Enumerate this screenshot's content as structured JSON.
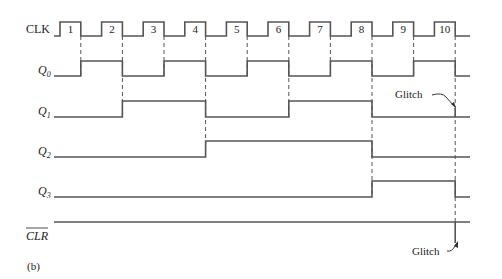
{
  "figure": {
    "caption": "(b)",
    "clock": {
      "label": "CLK",
      "pulse_numbers": [
        "1",
        "2",
        "3",
        "4",
        "5",
        "6",
        "7",
        "8",
        "9",
        "10"
      ]
    },
    "signals": [
      {
        "name": "Q",
        "subscript": "0",
        "initial": 0,
        "values_after_each_clk": [
          1,
          0,
          1,
          0,
          1,
          0,
          1,
          0,
          1,
          0
        ]
      },
      {
        "name": "Q",
        "subscript": "1",
        "initial": 0,
        "values_after_each_clk": [
          0,
          1,
          1,
          0,
          0,
          1,
          1,
          0,
          0,
          0
        ]
      },
      {
        "name": "Q",
        "subscript": "2",
        "initial": 0,
        "values_after_each_clk": [
          0,
          0,
          0,
          1,
          1,
          1,
          1,
          0,
          0,
          0
        ]
      },
      {
        "name": "Q",
        "subscript": "3",
        "initial": 0,
        "values_after_each_clk": [
          0,
          0,
          0,
          0,
          0,
          0,
          0,
          1,
          1,
          0
        ]
      }
    ],
    "clear": {
      "label": "CLR",
      "overbar": true,
      "level": 1,
      "glitch_at_clk": 10
    },
    "annotations": [
      {
        "text": "Glitch",
        "target": "Q1 at clock 10"
      },
      {
        "text": "Glitch",
        "target": "CLR at clock 10"
      }
    ],
    "dashed_edges_at_clk": [
      1,
      2,
      3,
      4,
      5,
      6,
      7,
      8,
      9,
      10
    ]
  }
}
